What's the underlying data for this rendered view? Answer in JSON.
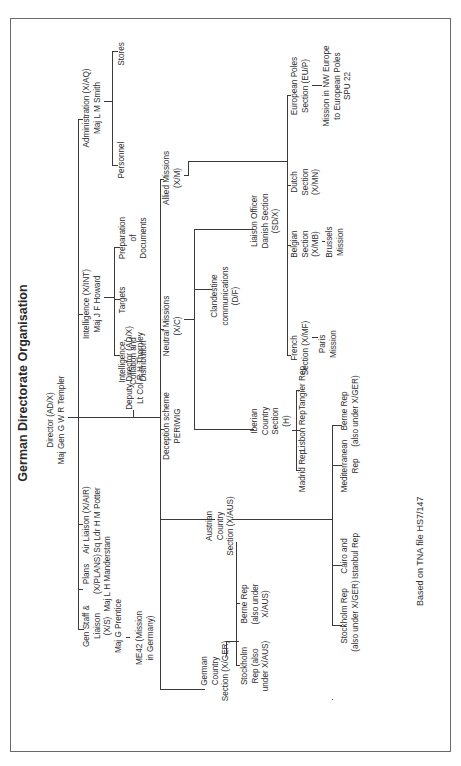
{
  "title": "German Directorate Organisation",
  "footer": "Based on TNA file HS7/147",
  "colors": {
    "line": "#3a3a3a",
    "text": "#2e2e2e",
    "border": "#6a6a6a",
    "background": "#ffffff"
  },
  "director": {
    "lines": [
      "Director (AD/X)",
      "Maj Gen G W R Templer"
    ]
  },
  "deputy": {
    "lines": [
      "Deputy Director (AD/X)",
      "Lt Col R H Thornley"
    ]
  },
  "top_level": {
    "gen_staff": {
      "lines": [
        "Gen Staff &",
        "Liaison",
        "(X/S)",
        "Maj G Prentice"
      ]
    },
    "me42": {
      "lines": [
        "ME42 (Mission",
        "in Germany)"
      ]
    },
    "plans": {
      "lines": [
        "Plans",
        "(X/PLANS)",
        "Maj L H Manderstam"
      ]
    },
    "air_liaison": {
      "lines": [
        "Air Liaison (X/AIR)",
        "Sq Ldr H M Potter"
      ]
    },
    "intelligence": {
      "lines": [
        "Intelligence (X/INT)",
        "Maj J F Howard"
      ]
    },
    "int_collation": {
      "lines": [
        "Intelligence,",
        "Collation and",
        "Distribution"
      ]
    },
    "targets": {
      "lines": [
        "Targets"
      ]
    },
    "preparation": {
      "lines": [
        "Preparation",
        "of",
        "Documents"
      ]
    },
    "administration": {
      "lines": [
        "Administration (X/AQ)",
        "Maj L M Smith"
      ]
    },
    "personnel": {
      "lines": [
        "Personnel"
      ]
    },
    "stores": {
      "lines": [
        "Stores"
      ]
    }
  },
  "second_level": {
    "german_country": {
      "lines": [
        "German",
        "Country",
        "Section (X/GER)"
      ]
    },
    "stockholm_rep_a": {
      "lines": [
        "Stockholm",
        "Rep (also",
        "under X/AUS)"
      ]
    },
    "berne_rep_a": {
      "lines": [
        "Berne Rep",
        "(also under",
        "X/AUS)"
      ]
    },
    "austrian_country": {
      "lines": [
        "Austrian",
        "Country",
        "Section (X/AUS)"
      ]
    },
    "stockholm_rep_b": {
      "lines": [
        "Stockholm Rep",
        "(also under X/GER)"
      ]
    },
    "cairo_istanbul": {
      "lines": [
        "Cairo and",
        "Istanbul Rep"
      ]
    },
    "mediterranean": {
      "lines": [
        "Mediterranean",
        "Rep"
      ]
    },
    "berne_rep_b": {
      "lines": [
        "Berne Rep",
        "(also under X/GER)"
      ]
    },
    "deception": {
      "lines": [
        "Deception scheme",
        "PERIWIG"
      ]
    },
    "neutral_missions": {
      "lines": [
        "Neutral Missions",
        "(X/C)"
      ]
    },
    "iberian": {
      "lines": [
        "Iberian",
        "Country",
        "Section",
        "(H)"
      ]
    },
    "madrid": {
      "lines": [
        "Madrid Rep"
      ]
    },
    "lisbon": {
      "lines": [
        "Lisbon Rep"
      ]
    },
    "tangier": {
      "lines": [
        "Tangier Rep"
      ]
    },
    "clandestine": {
      "lines": [
        "Clandestine",
        "communications",
        "(D/F)"
      ]
    },
    "liaison_danish": {
      "lines": [
        "Liaison Officer",
        "Danish Section",
        "(SD/X)"
      ]
    },
    "allied_missions": {
      "lines": [
        "Allied Missions",
        "(X/M)"
      ]
    },
    "french": {
      "lines": [
        "French",
        "Section (X/MF)"
      ]
    },
    "paris": {
      "lines": [
        "Paris",
        "Mission"
      ]
    },
    "belgian": {
      "lines": [
        "Belgian",
        "Section",
        "(X/MB)"
      ]
    },
    "brussels": {
      "lines": [
        "Brussels",
        "Mission"
      ]
    },
    "dutch": {
      "lines": [
        "Dutch",
        "Section",
        "(X/MN)"
      ]
    },
    "european_poles": {
      "lines": [
        "European Poles",
        "Section (EU/P)"
      ]
    },
    "poles_mission": {
      "lines": [
        "Mission in NW Europe",
        "to European Poles",
        "SPU 22"
      ]
    }
  }
}
